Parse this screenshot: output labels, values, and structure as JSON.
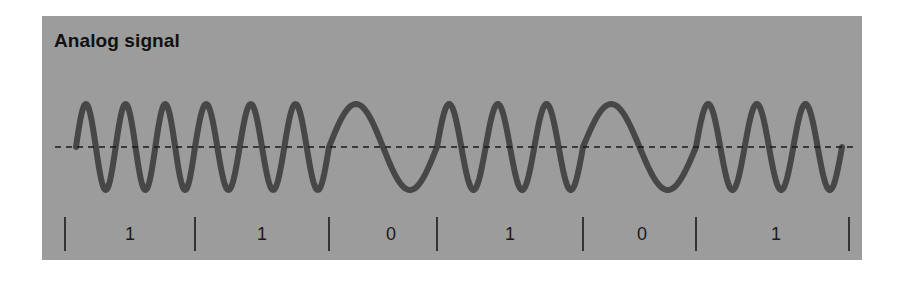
{
  "title": "Analog signal",
  "colors": {
    "panel_bg": "#9c9c9c",
    "wave_stroke": "#474747",
    "baseline": "#1a1a1a",
    "divider": "#1a1a1a",
    "text": "#111111"
  },
  "geometry": {
    "midline_y": 147,
    "amplitude": 43,
    "wave_stroke_width": 6,
    "baseline_x": [
      55,
      853
    ],
    "divider_y": [
      217,
      251
    ],
    "label_y": 240
  },
  "dividers_x": [
    65,
    195,
    329,
    437,
    583,
    696,
    849
  ],
  "segments": [
    {
      "bit": "1",
      "wave_x": [
        76,
        195
      ],
      "cycles": 3,
      "label_x": 130
    },
    {
      "bit": "1",
      "wave_x": [
        195,
        329
      ],
      "cycles": 3,
      "label_x": 262
    },
    {
      "bit": "0",
      "wave_x": [
        329,
        437
      ],
      "cycles": 1,
      "label_x": 391
    },
    {
      "bit": "1",
      "wave_x": [
        437,
        583
      ],
      "cycles": 3,
      "label_x": 510
    },
    {
      "bit": "0",
      "wave_x": [
        583,
        696
      ],
      "cycles": 1,
      "label_x": 642
    },
    {
      "bit": "1",
      "wave_x": [
        696,
        842
      ],
      "cycles": 3,
      "label_x": 776
    }
  ]
}
